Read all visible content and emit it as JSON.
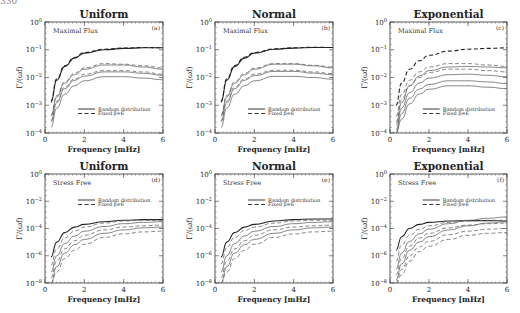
{
  "page_number": "330",
  "chart_data": [
    {
      "id": "a",
      "type": "line",
      "title": "Uniform",
      "panel_label": "(a)",
      "annotation": "Maximal Flux",
      "xlabel": "Frequency [mHz]",
      "ylabel": "Γ/(ωf)",
      "xlim": [
        0,
        6
      ],
      "xticks": [
        "0",
        "2",
        "4",
        "6"
      ],
      "ylim_log10": [
        -4,
        0
      ],
      "yticks": [
        "10^0",
        "10^-1",
        "10^-2",
        "10^-3",
        "10^-4"
      ],
      "legend": [
        "Random distribution",
        "Fixed β=6"
      ],
      "legend_position": "lower-middle",
      "x": [
        0.3,
        0.6,
        1.0,
        1.5,
        2.0,
        3.0,
        4.0,
        5.0,
        6.0
      ],
      "series": [
        {
          "name": "Random distribution",
          "style": "solid",
          "log10_values": [
            -2.9,
            -2.1,
            -1.6,
            -1.3,
            -1.12,
            -1.0,
            -0.95,
            -0.93,
            -0.93
          ]
        },
        {
          "name": "Fixed β=6",
          "style": "dashed",
          "log10_values": [
            -2.85,
            -2.05,
            -1.58,
            -1.28,
            -1.1,
            -0.98,
            -0.94,
            -0.92,
            -0.93
          ]
        },
        {
          "name": "Random distribution",
          "style": "solid",
          "log10_values": [
            -3.4,
            -2.7,
            -2.2,
            -1.9,
            -1.7,
            -1.55,
            -1.55,
            -1.62,
            -1.7
          ]
        },
        {
          "name": "Fixed β=6",
          "style": "dashed",
          "log10_values": [
            -3.35,
            -2.65,
            -2.15,
            -1.85,
            -1.65,
            -1.5,
            -1.52,
            -1.58,
            -1.65
          ]
        },
        {
          "name": "Random distribution",
          "style": "solid",
          "log10_values": [
            -3.6,
            -2.9,
            -2.4,
            -2.1,
            -1.95,
            -1.8,
            -1.8,
            -1.85,
            -1.92
          ]
        },
        {
          "name": "Fixed β=6",
          "style": "dashed",
          "log10_values": [
            -3.55,
            -2.85,
            -2.35,
            -2.05,
            -1.88,
            -1.75,
            -1.75,
            -1.8,
            -1.88
          ]
        },
        {
          "name": "Random distribution",
          "style": "solid",
          "log10_values": [
            -3.8,
            -3.1,
            -2.6,
            -2.3,
            -2.12,
            -1.97,
            -1.97,
            -2.02,
            -2.08
          ]
        }
      ]
    },
    {
      "id": "b",
      "type": "line",
      "title": "Normal",
      "panel_label": "(b)",
      "annotation": "Maximal Flux",
      "xlabel": "Frequency [mHz]",
      "ylabel": "Γ/(ωf)",
      "xlim": [
        0,
        6
      ],
      "xticks": [
        "0",
        "2",
        "4",
        "6"
      ],
      "ylim_log10": [
        -4,
        0
      ],
      "yticks": [
        "10^0",
        "10^-1",
        "10^-2",
        "10^-3",
        "10^-4"
      ],
      "legend": [
        "Random distribution",
        "Fixed β=6"
      ],
      "legend_position": "lower-middle",
      "x": [
        0.3,
        0.6,
        1.0,
        1.5,
        2.0,
        3.0,
        4.0,
        5.0,
        6.0
      ],
      "series": [
        {
          "name": "Random distribution",
          "style": "solid",
          "log10_values": [
            -2.9,
            -2.1,
            -1.6,
            -1.3,
            -1.12,
            -0.98,
            -0.94,
            -0.92,
            -0.92
          ]
        },
        {
          "name": "Fixed β=6",
          "style": "dashed",
          "log10_values": [
            -2.85,
            -2.05,
            -1.57,
            -1.27,
            -1.1,
            -0.97,
            -0.93,
            -0.91,
            -0.92
          ]
        },
        {
          "name": "Random distribution",
          "style": "solid",
          "log10_values": [
            -3.4,
            -2.7,
            -2.2,
            -1.9,
            -1.7,
            -1.52,
            -1.52,
            -1.58,
            -1.65
          ]
        },
        {
          "name": "Fixed β=6",
          "style": "dashed",
          "log10_values": [
            -3.35,
            -2.65,
            -2.15,
            -1.85,
            -1.66,
            -1.5,
            -1.5,
            -1.56,
            -1.62
          ]
        },
        {
          "name": "Random distribution",
          "style": "solid",
          "log10_values": [
            -3.6,
            -2.9,
            -2.4,
            -2.1,
            -1.93,
            -1.78,
            -1.78,
            -1.84,
            -1.9
          ]
        },
        {
          "name": "Fixed β=6",
          "style": "dashed",
          "log10_values": [
            -3.55,
            -2.85,
            -2.35,
            -2.05,
            -1.88,
            -1.74,
            -1.74,
            -1.8,
            -1.86
          ]
        },
        {
          "name": "Random distribution",
          "style": "solid",
          "log10_values": [
            -3.8,
            -3.1,
            -2.6,
            -2.3,
            -2.12,
            -1.96,
            -1.96,
            -2.0,
            -2.06
          ]
        }
      ]
    },
    {
      "id": "c",
      "type": "line",
      "title": "Exponential",
      "panel_label": "(c)",
      "annotation": "Maximal Flux",
      "xlabel": "Frequency [mHz]",
      "ylabel": "Γ/(ωf)",
      "xlim": [
        0,
        6
      ],
      "xticks": [
        "0",
        "2",
        "4",
        "6"
      ],
      "ylim_log10": [
        -4,
        0
      ],
      "yticks": [
        "10^0",
        "10^-1",
        "10^-2",
        "10^-3",
        "10^-4"
      ],
      "legend": [
        "Random distribution",
        "Fixed β=6"
      ],
      "legend_position": "lower-middle",
      "x": [
        0.3,
        0.6,
        1.0,
        1.5,
        2.0,
        3.0,
        4.0,
        5.0,
        6.0
      ],
      "series": [
        {
          "name": "Fixed β=6",
          "style": "dashed",
          "log10_values": [
            -3.0,
            -2.2,
            -1.7,
            -1.4,
            -1.2,
            -1.05,
            -0.98,
            -0.95,
            -0.93
          ]
        },
        {
          "name": "Random distribution",
          "style": "solid",
          "log10_values": [
            -3.7,
            -2.9,
            -2.3,
            -1.95,
            -1.75,
            -1.62,
            -1.6,
            -1.62,
            -1.65
          ]
        },
        {
          "name": "Fixed β=6",
          "style": "dashed",
          "log10_values": [
            -3.4,
            -2.6,
            -2.1,
            -1.8,
            -1.62,
            -1.5,
            -1.5,
            -1.55,
            -1.6
          ]
        },
        {
          "name": "Fixed β=6",
          "style": "dashed",
          "log10_values": [
            -3.6,
            -2.8,
            -2.3,
            -2.0,
            -1.82,
            -1.7,
            -1.7,
            -1.75,
            -1.8
          ]
        },
        {
          "name": "Random distribution",
          "style": "solid",
          "log10_values": [
            -3.9,
            -3.1,
            -2.55,
            -2.2,
            -2.02,
            -1.9,
            -1.88,
            -1.92,
            -1.97
          ]
        },
        {
          "name": "Random distribution",
          "style": "solid",
          "log10_values": [
            -4.0,
            -3.3,
            -2.75,
            -2.42,
            -2.25,
            -2.12,
            -2.12,
            -2.16,
            -2.22
          ]
        },
        {
          "name": "Random distribution",
          "style": "solid",
          "log10_values": [
            -4.0,
            -3.5,
            -2.95,
            -2.6,
            -2.42,
            -2.3,
            -2.3,
            -2.35,
            -2.4
          ]
        }
      ]
    },
    {
      "id": "d",
      "type": "line",
      "title": "Uniform",
      "panel_label": "(d)",
      "annotation": "Stress Free",
      "xlabel": "Frequency [mHz]",
      "ylabel": "Γ/(ωf)",
      "xlim": [
        0,
        6
      ],
      "xticks": [
        "0",
        "2",
        "4",
        "6"
      ],
      "ylim_log10": [
        -8,
        0
      ],
      "yticks": [
        "10^0",
        "10^-2",
        "10^-4",
        "10^-6",
        "10^-8"
      ],
      "legend": [
        "Random distribution",
        "Fixed β=6"
      ],
      "legend_position": "upper-middle",
      "x": [
        0.3,
        0.6,
        1.0,
        1.5,
        2.0,
        3.0,
        4.0,
        5.0,
        6.0
      ],
      "series": [
        {
          "name": "Random distribution",
          "style": "solid",
          "log10_values": [
            -6.1,
            -5.0,
            -4.3,
            -3.9,
            -3.7,
            -3.5,
            -3.4,
            -3.35,
            -3.35
          ]
        },
        {
          "name": "Fixed β=6",
          "style": "dashed",
          "log10_values": [
            -6.7,
            -5.5,
            -4.7,
            -4.2,
            -3.9,
            -3.6,
            -3.45,
            -3.4,
            -3.4
          ]
        },
        {
          "name": "Random distribution",
          "style": "solid",
          "log10_values": [
            -7.2,
            -6.0,
            -5.1,
            -4.55,
            -4.2,
            -3.85,
            -3.65,
            -3.55,
            -3.5
          ]
        },
        {
          "name": "Fixed β=6",
          "style": "dashed",
          "log10_values": [
            -7.6,
            -6.4,
            -5.5,
            -4.9,
            -4.5,
            -4.1,
            -3.9,
            -3.8,
            -3.75
          ]
        },
        {
          "name": "Random distribution",
          "style": "solid",
          "log10_values": [
            -8.0,
            -6.8,
            -5.8,
            -5.2,
            -4.8,
            -4.35,
            -4.1,
            -3.95,
            -3.9
          ]
        },
        {
          "name": "Fixed β=6",
          "style": "dashed",
          "log10_values": [
            -8.0,
            -7.2,
            -6.2,
            -5.6,
            -5.15,
            -4.65,
            -4.4,
            -4.25,
            -4.2
          ]
        }
      ]
    },
    {
      "id": "e",
      "type": "line",
      "title": "Normal",
      "panel_label": "(e)",
      "annotation": "Stress Free",
      "xlabel": "Frequency [mHz]",
      "ylabel": "Γ/(ωf)",
      "xlim": [
        0,
        6
      ],
      "xticks": [
        "0",
        "2",
        "4",
        "6"
      ],
      "ylim_log10": [
        -8,
        0
      ],
      "yticks": [
        "10^0",
        "10^-2",
        "10^-4",
        "10^-6",
        "10^-8"
      ],
      "legend": [
        "Random distribution",
        "Fixed β=6"
      ],
      "legend_position": "upper-middle",
      "x": [
        0.3,
        0.6,
        1.0,
        1.5,
        2.0,
        3.0,
        4.0,
        5.0,
        6.0
      ],
      "series": [
        {
          "name": "Random distribution",
          "style": "solid",
          "log10_values": [
            -6.1,
            -5.0,
            -4.3,
            -3.9,
            -3.7,
            -3.45,
            -3.35,
            -3.3,
            -3.3
          ]
        },
        {
          "name": "Fixed β=6",
          "style": "dashed",
          "log10_values": [
            -6.6,
            -5.4,
            -4.65,
            -4.15,
            -3.9,
            -3.6,
            -3.45,
            -3.4,
            -3.4
          ]
        },
        {
          "name": "Random distribution",
          "style": "solid",
          "log10_values": [
            -7.2,
            -6.0,
            -5.1,
            -4.55,
            -4.2,
            -3.85,
            -3.65,
            -3.55,
            -3.5
          ]
        },
        {
          "name": "Fixed β=6",
          "style": "dashed",
          "log10_values": [
            -7.6,
            -6.4,
            -5.5,
            -4.9,
            -4.5,
            -4.1,
            -3.9,
            -3.8,
            -3.75
          ]
        },
        {
          "name": "Random distribution",
          "style": "solid",
          "log10_values": [
            -8.0,
            -6.8,
            -5.8,
            -5.2,
            -4.8,
            -4.35,
            -4.1,
            -3.95,
            -3.9
          ]
        },
        {
          "name": "Fixed β=6",
          "style": "dashed",
          "log10_values": [
            -8.0,
            -7.2,
            -6.2,
            -5.6,
            -5.15,
            -4.65,
            -4.4,
            -4.25,
            -4.2
          ]
        }
      ]
    },
    {
      "id": "f",
      "type": "line",
      "title": "Exponential",
      "panel_label": "(f)",
      "annotation": "Stress Free",
      "xlabel": "Frequency [mHz]",
      "ylabel": "Γ/(ωf)",
      "xlim": [
        0,
        6
      ],
      "xticks": [
        "0",
        "2",
        "4",
        "6"
      ],
      "ylim_log10": [
        -8,
        0
      ],
      "yticks": [
        "10^0",
        "10^-2",
        "10^-4",
        "10^-6",
        "10^-8"
      ],
      "legend": [
        "Random distribution",
        "Fixed β=6"
      ],
      "legend_position": "upper-middle",
      "x": [
        0.3,
        0.6,
        1.0,
        1.5,
        2.0,
        3.0,
        4.0,
        5.0,
        6.0
      ],
      "series": [
        {
          "name": "Random distribution",
          "style": "solid",
          "log10_values": [
            -5.6,
            -4.6,
            -4.0,
            -3.7,
            -3.55,
            -3.45,
            -3.42,
            -3.42,
            -3.45
          ]
        },
        {
          "name": "Fixed β=6",
          "style": "dashed",
          "log10_values": [
            -6.4,
            -5.2,
            -4.5,
            -4.05,
            -3.8,
            -3.55,
            -3.45,
            -3.4,
            -3.4
          ]
        },
        {
          "name": "Random distribution",
          "style": "solid",
          "log10_values": [
            -7.0,
            -5.8,
            -4.95,
            -4.4,
            -4.05,
            -3.65,
            -3.4,
            -3.25,
            -3.15
          ]
        },
        {
          "name": "Fixed β=6",
          "style": "dashed",
          "log10_values": [
            -7.4,
            -6.2,
            -5.3,
            -4.7,
            -4.35,
            -3.95,
            -3.75,
            -3.65,
            -3.6
          ]
        },
        {
          "name": "Random distribution",
          "style": "solid",
          "log10_values": [
            -7.8,
            -6.6,
            -5.6,
            -5.0,
            -4.6,
            -4.1,
            -3.8,
            -3.6,
            -3.5
          ]
        },
        {
          "name": "Fixed β=6",
          "style": "dashed",
          "log10_values": [
            -8.0,
            -7.0,
            -6.0,
            -5.35,
            -4.95,
            -4.45,
            -4.2,
            -4.05,
            -4.0
          ]
        },
        {
          "name": "Fixed β=6",
          "style": "dashed",
          "log10_values": [
            -8.0,
            -7.4,
            -6.4,
            -5.7,
            -5.3,
            -4.8,
            -4.5,
            -4.35,
            -4.3
          ]
        }
      ]
    }
  ]
}
